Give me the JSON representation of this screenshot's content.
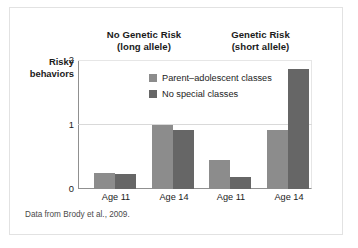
{
  "figure": {
    "source_note": "Data from Brody et al., 2009."
  },
  "chart_data": {
    "type": "bar",
    "title": "",
    "xlabel": "",
    "ylabel": "Risky behaviors",
    "ylabel_line1": "Risky",
    "ylabel_line2": "behaviors",
    "ylim": [
      0,
      2
    ],
    "yticks": [
      0,
      1,
      2
    ],
    "ytick_labels": [
      "0",
      "1",
      "2"
    ],
    "grid": true,
    "grid_axis": "y",
    "legend_position": "inside-top-center",
    "group_headers": [
      {
        "line1": "No Genetic Risk",
        "line2": "(long allele)"
      },
      {
        "line1": "Genetic Risk",
        "line2": "(short allele)"
      }
    ],
    "categories": [
      "Age 11",
      "Age 14",
      "Age 11",
      "Age 14"
    ],
    "series": [
      {
        "name": "Parent–adolescent classes",
        "color": "#8c8c8c",
        "values": [
          0.25,
          1.0,
          0.45,
          0.92
        ]
      },
      {
        "name": "No special classes",
        "color": "#666666",
        "values": [
          0.23,
          0.92,
          0.18,
          1.86
        ]
      }
    ],
    "bars": [
      {
        "group": "No Genetic Risk (long allele)",
        "category": "Age 11",
        "series": "Parent–adolescent classes",
        "value": 0.25
      },
      {
        "group": "No Genetic Risk (long allele)",
        "category": "Age 11",
        "series": "No special classes",
        "value": 0.23
      },
      {
        "group": "No Genetic Risk (long allele)",
        "category": "Age 14",
        "series": "Parent–adolescent classes",
        "value": 1.0
      },
      {
        "group": "No Genetic Risk (long allele)",
        "category": "Age 14",
        "series": "No special classes",
        "value": 0.92
      },
      {
        "group": "Genetic Risk (short allele)",
        "category": "Age 11",
        "series": "Parent–adolescent classes",
        "value": 0.45
      },
      {
        "group": "Genetic Risk (short allele)",
        "category": "Age 11",
        "series": "No special classes",
        "value": 0.18
      },
      {
        "group": "Genetic Risk (short allele)",
        "category": "Age 14",
        "series": "Parent–adolescent classes",
        "value": 0.92
      },
      {
        "group": "Genetic Risk (short allele)",
        "category": "Age 14",
        "series": "No special classes",
        "value": 1.86
      }
    ],
    "colors": {
      "series_light": "#8c8c8c",
      "series_dark": "#666666",
      "axis": "#909090",
      "grid": "#d9d9d9",
      "text": "#1b1b1b",
      "card_border": "#e2e2e2",
      "background": "#ffffff"
    }
  }
}
